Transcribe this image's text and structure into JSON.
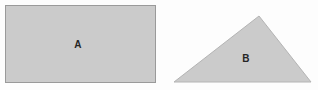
{
  "figure": {
    "width": 318,
    "height": 90,
    "background_color": "#fdfdfd",
    "shapes": [
      {
        "id": "rectangle-a",
        "kind": "rectangle",
        "label": "A",
        "fill_color": "#cbcbcb",
        "stroke_color": "#9a9a9a",
        "stroke_width": 1,
        "x": 5,
        "y": 5,
        "width": 150,
        "height": 77,
        "label_x": 78,
        "label_y": 44
      },
      {
        "id": "triangle-b",
        "kind": "triangle",
        "label": "B",
        "fill_color": "#cbcbcb",
        "stroke_color": "#b4b4b4",
        "stroke_width": 1,
        "points": "174,82 259,16 311,82",
        "vertices": [
          {
            "x": 174,
            "y": 82
          },
          {
            "x": 259,
            "y": 16
          },
          {
            "x": 311,
            "y": 82
          }
        ],
        "label_x": 246,
        "label_y": 58
      }
    ]
  }
}
